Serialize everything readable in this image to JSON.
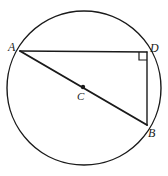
{
  "figure": {
    "background_color": "#ffffff",
    "stroke_color": "#1a1a1a",
    "labels": {
      "A": "A",
      "B": "B",
      "C": "C",
      "D": "D"
    },
    "points": {
      "A": {
        "x": 20,
        "y": 51,
        "name": "point-a"
      },
      "B": {
        "x": 147,
        "y": 125,
        "name": "point-b"
      },
      "C": {
        "x": 83,
        "y": 87,
        "name": "center-c"
      },
      "D": {
        "x": 147,
        "y": 52,
        "name": "point-d"
      }
    },
    "circle": {
      "cx": 84,
      "cy": 88,
      "r": 77,
      "stroke_width": 1.4
    },
    "segments": [
      {
        "name": "segment-ad",
        "from": "A",
        "to": "D",
        "stroke_width": 1.4
      },
      {
        "name": "segment-db",
        "from": "D",
        "to": "B",
        "stroke_width": 1.4
      },
      {
        "name": "segment-ab-diameter",
        "from": "A",
        "to": "B",
        "stroke_width": 2.0
      }
    ],
    "right_angle_marker": {
      "name": "right-angle-marker-d",
      "at_vertex": "D",
      "size": 8,
      "x": 139,
      "y": 52
    },
    "center_dot": {
      "name": "center-dot",
      "cx": 83,
      "cy": 87,
      "r": 2.2
    }
  }
}
